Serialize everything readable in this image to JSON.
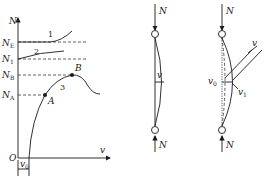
{
  "graph": {
    "y_axis_label": "N",
    "x_axis_label": "v",
    "origin_label": "O",
    "x_offset_label": "v",
    "x_offset_sub": "0",
    "levels": [
      {
        "name": "N",
        "sub": "E"
      },
      {
        "name": "N",
        "sub": "1"
      },
      {
        "name": "N",
        "sub": "B"
      },
      {
        "name": "N",
        "sub": "A"
      }
    ],
    "curve_labels": [
      "1",
      "2",
      "3"
    ],
    "points": [
      "A",
      "B"
    ]
  },
  "column_straight": {
    "top_force": "N",
    "bottom_force": "N",
    "deflection_label": "v"
  },
  "column_imperfect": {
    "top_force": "N",
    "bottom_force": "N",
    "deflection_label": "v",
    "initial_label": "v",
    "initial_sub": "0",
    "total_label": "v",
    "total_sub": "1"
  }
}
